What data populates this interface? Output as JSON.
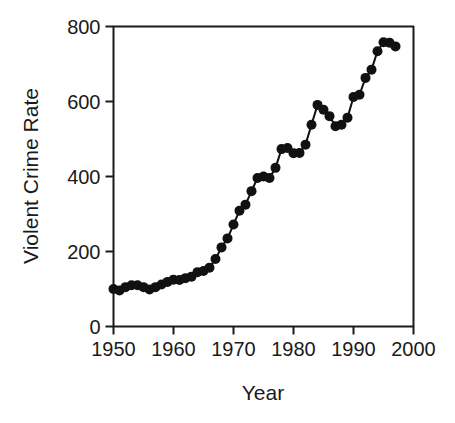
{
  "chart_data": {
    "type": "line",
    "title": "",
    "xlabel": "Year",
    "ylabel": "Violent Crime Rate",
    "xlim": [
      1950,
      2000
    ],
    "ylim": [
      0,
      800
    ],
    "xticks": [
      1950,
      1960,
      1970,
      1980,
      1990,
      2000
    ],
    "xtick_labels": [
      "1950",
      "1960",
      "1970",
      "1980",
      "1990",
      "2000"
    ],
    "yticks": [
      0,
      200,
      400,
      600,
      800
    ],
    "ytick_labels": [
      "0",
      "200",
      "400",
      "600",
      "800"
    ],
    "grid": false,
    "legend": null,
    "series": [
      {
        "name": "Violent Crime Rate",
        "color": "#111111",
        "marker": "filled-circle",
        "marker_size": 5,
        "line_width": 2,
        "x": [
          1950,
          1951,
          1952,
          1953,
          1954,
          1955,
          1956,
          1957,
          1958,
          1959,
          1960,
          1961,
          1962,
          1963,
          1964,
          1965,
          1966,
          1967,
          1968,
          1969,
          1970,
          1971,
          1972,
          1973,
          1974,
          1975,
          1976,
          1977,
          1978,
          1979,
          1980,
          1981,
          1982,
          1983,
          1984,
          1985,
          1986,
          1987,
          1988,
          1989,
          1990,
          1991,
          1992,
          1993,
          1994,
          1995,
          1996,
          1997
        ],
        "values": [
          100,
          96,
          105,
          110,
          110,
          105,
          99,
          105,
          112,
          119,
          125,
          124,
          129,
          133,
          145,
          148,
          157,
          180,
          211,
          235,
          272,
          309,
          325,
          361,
          396,
          400,
          396,
          423,
          473,
          476,
          462,
          463,
          485,
          538,
          591,
          578,
          561,
          534,
          538,
          557,
          612,
          618,
          663,
          685,
          734,
          758,
          757,
          747
        ]
      }
    ]
  },
  "axis": {
    "x_title": "Year",
    "y_title": "Violent Crime Rate"
  }
}
